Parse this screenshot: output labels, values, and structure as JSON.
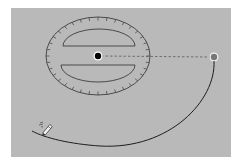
{
  "diagram": {
    "colors": {
      "background": "#ffffff",
      "panel": "#b9b9b9",
      "stroke": "#4a4a4a",
      "curve": "#1e1e1e",
      "center_dot": "#000000",
      "handle_fill": "#7a7a7a",
      "handle_ring": "#ffffff"
    },
    "dial": {
      "cx": 98,
      "cy": 56,
      "rx": 52,
      "ry": 39,
      "tick_count": 36
    },
    "center_dot": {
      "cx": 98,
      "cy": 56,
      "r": 3.5
    },
    "handle": {
      "cx": 214,
      "cy": 57,
      "r": 4
    },
    "dashed_line": {
      "x1": 101,
      "y1": 56,
      "x2": 210,
      "y2": 57
    },
    "trace_curve": {
      "path": "M 214 61 C 216 100 170 150 100 146 C 70 144 45 138 32 131"
    },
    "icons": [
      "pencil-icon"
    ]
  }
}
